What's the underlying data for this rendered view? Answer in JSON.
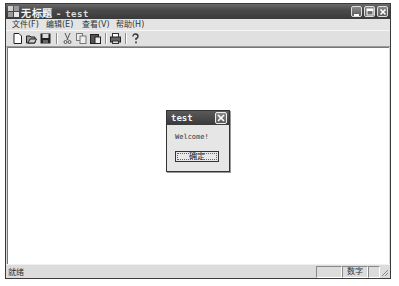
{
  "window": {
    "title": "无标题",
    "separator": "-",
    "app_name": "test",
    "caption_buttons": [
      "minimize",
      "maximize",
      "close"
    ]
  },
  "menubar": {
    "items": [
      {
        "label": "文件(F)"
      },
      {
        "label": "编辑(E)"
      },
      {
        "label": "查看(V)"
      },
      {
        "label": "帮助(H)"
      }
    ]
  },
  "toolbar": {
    "buttons": [
      "new-icon",
      "open-icon",
      "save-icon",
      "cut-icon",
      "copy-icon",
      "paste-icon",
      "print-icon",
      "help-icon"
    ]
  },
  "dialog": {
    "title": "test",
    "message": "Welcome!",
    "ok_label": "确定"
  },
  "statusbar": {
    "ready": "就绪",
    "panes": [
      "",
      "数字",
      ""
    ]
  }
}
